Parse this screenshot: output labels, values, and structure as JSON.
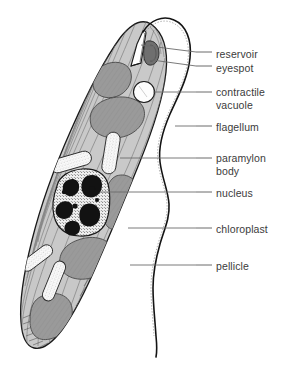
{
  "diagram": {
    "organism": "Euglena",
    "background_color": "#ffffff",
    "colors": {
      "cytoplasm": "#c9c9c9",
      "cytoplasm_light": "#d4d4d4",
      "chloroplast": "#9a9a9a",
      "chloroplast_dark": "#8d8d8d",
      "paramylon": "#f7f7f7",
      "nucleus_fill": "#ededed",
      "chromatin": "#121212",
      "eyespot": "#7d7d7d",
      "reservoir": "#ffffff",
      "outline": "#1a1a1a",
      "leader_line": "#6b6b6b",
      "label_text": "#3b3b3b"
    },
    "labels": [
      {
        "id": "reservoir",
        "text": "reservoir",
        "text2": "",
        "x": 216,
        "y": 48,
        "leader_x1": 196,
        "leader_x2": 212,
        "leader_y": 52,
        "target_x": 141,
        "target_y": 45
      },
      {
        "id": "eyespot",
        "text": "eyespot",
        "text2": "",
        "x": 216,
        "y": 62,
        "leader_x1": 196,
        "leader_x2": 212,
        "leader_y": 66,
        "target_x": 152,
        "target_y": 60
      },
      {
        "id": "contractile-vacuole",
        "text": "contractile",
        "text2": "vacuole",
        "x": 216,
        "y": 86,
        "leader_x1": 196,
        "leader_x2": 212,
        "leader_y": 92,
        "target_x": 153,
        "target_y": 92
      },
      {
        "id": "flagellum",
        "text": "flagellum",
        "text2": "",
        "x": 216,
        "y": 121,
        "leader_x1": 196,
        "leader_x2": 212,
        "leader_y": 126,
        "target_x": 175,
        "target_y": 126
      },
      {
        "id": "paramylon-body",
        "text": "paramylon",
        "text2": "body",
        "x": 216,
        "y": 152,
        "leader_x1": 196,
        "leader_x2": 212,
        "leader_y": 158,
        "target_x": 120,
        "target_y": 158
      },
      {
        "id": "nucleus",
        "text": "nucleus",
        "text2": "",
        "x": 216,
        "y": 187,
        "leader_x1": 196,
        "leader_x2": 212,
        "leader_y": 192,
        "target_x": 100,
        "target_y": 192
      },
      {
        "id": "chloroplast",
        "text": "chloroplast",
        "text2": "",
        "x": 216,
        "y": 223,
        "leader_x1": 196,
        "leader_x2": 212,
        "leader_y": 228,
        "target_x": 128,
        "target_y": 228
      },
      {
        "id": "pellicle",
        "text": "pellicle",
        "text2": "",
        "x": 216,
        "y": 260,
        "leader_x1": 196,
        "leader_x2": 212,
        "leader_y": 265,
        "target_x": 130,
        "target_y": 265
      }
    ],
    "structures": {
      "cell_body": "elongated teardrop, apex top-right, tail bottom-left",
      "flagellum": "long wavy filament emerging from reservoir, arcing right then descending",
      "reservoir": "white funnel opening at cell apex",
      "eyespot": "dark gray patch beside reservoir",
      "contractile_vacuole": "white circle below reservoir",
      "nucleus": "rounded-square stippled body with black chromatin masses",
      "paramylon_bodies": "white stippled rod/capsule shapes",
      "chloroplasts": "medium gray lobed patches",
      "pellicle": "diagonal striations along cell surface"
    }
  }
}
